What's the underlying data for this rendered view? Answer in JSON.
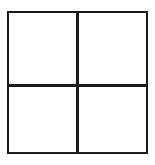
{
  "figure": {
    "title": "",
    "kind": "2x2-grid",
    "background_color": "#ffffff",
    "line_color": "#1a1a1a",
    "line_width_px": 2.5,
    "rows": 2,
    "columns": 2,
    "quadrants": [
      {
        "name": "top-left",
        "label": ""
      },
      {
        "name": "top-right",
        "label": ""
      },
      {
        "name": "bottom-left",
        "label": ""
      },
      {
        "name": "bottom-right",
        "label": ""
      }
    ]
  }
}
